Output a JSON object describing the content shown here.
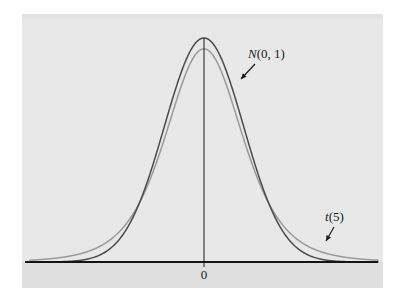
{
  "figure": {
    "panel": {
      "background_color": "#e8e8e8",
      "under_axis_color": "#dededf",
      "page_color": "#ffffff"
    },
    "axis": {
      "x_axis_color": "#141414",
      "center_line_color": "#3a3a3a",
      "origin_label": "0"
    },
    "annotations": [
      {
        "name": "normal-curve-label",
        "italic_part": "N",
        "rest_part": "(0, 1)",
        "full_text": "N(0, 1)",
        "points_to": "normal"
      },
      {
        "name": "t-curve-label",
        "italic_part": "t",
        "rest_part": "(5)",
        "full_text": "t(5)",
        "points_to": "t5"
      }
    ]
  },
  "chart_data": {
    "type": "line",
    "title": "",
    "subtitle": "",
    "xlabel": "",
    "ylabel": "",
    "xlim": [
      -4.4,
      4.4
    ],
    "ylim": [
      0,
      0.4
    ],
    "grid": false,
    "legend_position": "inline-annotations",
    "x_ticks": [
      0
    ],
    "x_tick_labels": [
      "0"
    ],
    "y_ticks": [],
    "y_tick_labels": [],
    "annotations": [
      "N(0, 1)",
      "t(5)"
    ],
    "series": [
      {
        "name": "N(0, 1)",
        "distribution": "normal",
        "mean": 0,
        "sd": 1,
        "peak_density": 0.3989,
        "color": "#4a4a4a",
        "stroke_width": 1.5,
        "label": "N(0, 1)"
      },
      {
        "name": "t(5)",
        "distribution": "student-t",
        "df": 5,
        "peak_density": 0.3796,
        "color": "#9a9a9a",
        "stroke_width": 1.5,
        "label": "t(5)"
      }
    ],
    "x": [
      -4.4,
      -4.0,
      -3.6,
      -3.2,
      -2.8,
      -2.4,
      -2.0,
      -1.6,
      -1.2,
      -0.8,
      -0.4,
      0.0,
      0.4,
      0.8,
      1.2,
      1.6,
      2.0,
      2.4,
      2.8,
      3.2,
      3.6,
      4.0,
      4.4
    ],
    "values_normal": [
      0.0001,
      0.0001,
      0.0006,
      0.0024,
      0.0079,
      0.0224,
      0.054,
      0.1109,
      0.1942,
      0.2897,
      0.3683,
      0.3989,
      0.3683,
      0.2897,
      0.1942,
      0.1109,
      0.054,
      0.0224,
      0.0079,
      0.0024,
      0.0006,
      0.0001,
      0.0001
    ],
    "values_t5": [
      0.0032,
      0.0051,
      0.0084,
      0.0142,
      0.0248,
      0.0442,
      0.0779,
      0.1297,
      0.1966,
      0.2691,
      0.3321,
      0.3796,
      0.3321,
      0.2691,
      0.1966,
      0.1297,
      0.0779,
      0.0442,
      0.0248,
      0.0142,
      0.0084,
      0.0051,
      0.0032
    ]
  }
}
